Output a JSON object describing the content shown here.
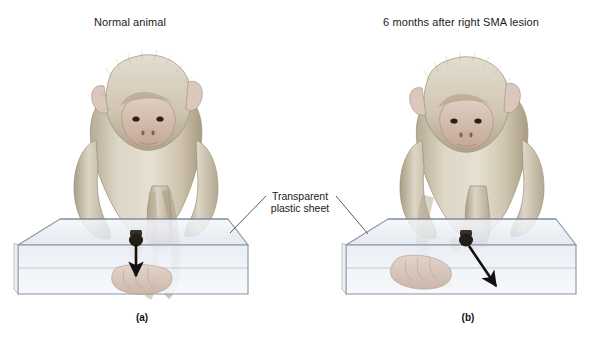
{
  "figure": {
    "panels": [
      {
        "id": "a",
        "title": "Normal animal",
        "caption": "(a)",
        "subject": "macaque-monkey",
        "arrow_direction": "straight-down-onto-hand"
      },
      {
        "id": "b",
        "title": "6 months after right SMA lesion",
        "caption": "(b)",
        "subject": "macaque-monkey",
        "arrow_direction": "diagonal-down-right-missing-hand"
      }
    ],
    "annotation": {
      "line1": "Transparent",
      "line2": "plastic sheet"
    },
    "colors": {
      "background": "#ffffff",
      "text": "#1a1a1a",
      "sheet_fill": "#eef1f5",
      "sheet_edge": "#8a93a5",
      "arrow": "#111111",
      "leader_line": "#4a4a4a",
      "fur_light": "#ded6c6",
      "fur_mid": "#c3b8a4",
      "fur_dark": "#9a8d78",
      "skin": "#d8c3b6",
      "sensor": "#2b2420"
    }
  }
}
